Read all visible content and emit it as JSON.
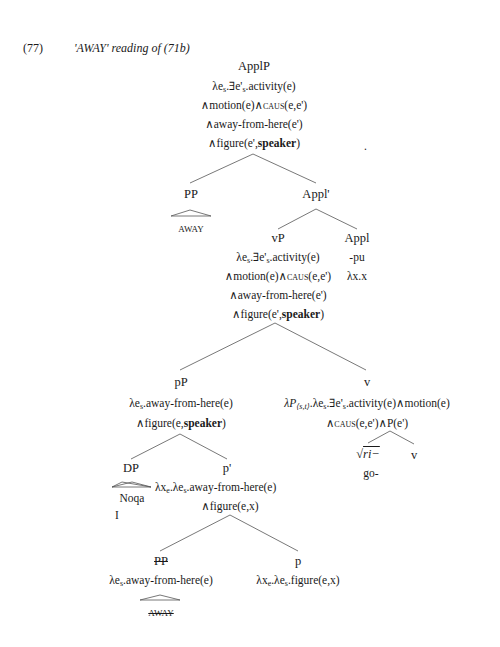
{
  "example": {
    "number": "(77)",
    "caption": "'AWAY' reading of (71b)"
  },
  "tree": {
    "applP": {
      "label": "ApplP",
      "sem": [
        "λes.∃e's.activity(e)",
        "∧motion(e)∧CAUS(e,e')",
        "∧away-from-here(e')",
        "∧figure(e',speaker)"
      ]
    },
    "pp_top": {
      "label": "PP",
      "leaf": "AWAY"
    },
    "applbar": {
      "label": "Appl'"
    },
    "vP": {
      "label": "vP",
      "sem": [
        "λes.∃e's.activity(e)",
        "∧motion(e)∧CAUS(e,e')",
        "∧away-from-here(e')",
        "∧figure(e',speaker)"
      ]
    },
    "appl": {
      "label": "Appl",
      "morph": "-pu",
      "sem": "λx.x"
    },
    "pP": {
      "label": "pP",
      "sem": [
        "λes.away-from-here(e)",
        "∧figure(e,speaker)"
      ]
    },
    "v_top": {
      "label": "v",
      "sem": [
        "λP⟨s,t⟩.λes.∃e's.activity(e)∧motion(e)",
        "∧CAUS(e,e')∧P(e')"
      ]
    },
    "root": {
      "label": "√ri−",
      "gloss": "go-"
    },
    "v_small": {
      "label": "v"
    },
    "dp": {
      "label": "DP",
      "leaf": "Noqa",
      "gloss": "I"
    },
    "pbar": {
      "label": "p'",
      "sem": [
        "λxe.λes.away-from-here(e)",
        "∧figure(e,x)"
      ]
    },
    "pp_low": {
      "label": "PP",
      "sem": "λes.away-from-here(e)",
      "leaf": "AWAY"
    },
    "p": {
      "label": "p",
      "sem": "λxe.λes.figure(e,x)"
    }
  },
  "stray_mark": "."
}
